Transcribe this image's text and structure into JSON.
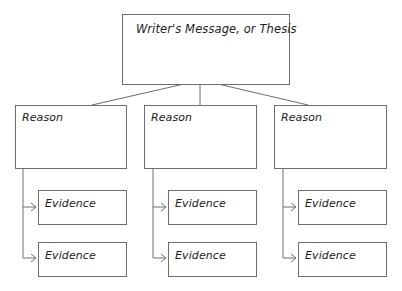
{
  "diagram": {
    "thesis": {
      "label": "Writer's Message, or Thesis"
    },
    "reasons": [
      {
        "label": "Reason",
        "evidence": [
          {
            "label": "Evidence"
          },
          {
            "label": "Evidence"
          }
        ]
      },
      {
        "label": "Reason",
        "evidence": [
          {
            "label": "Evidence"
          },
          {
            "label": "Evidence"
          }
        ]
      },
      {
        "label": "Reason",
        "evidence": [
          {
            "label": "Evidence"
          },
          {
            "label": "Evidence"
          }
        ]
      }
    ],
    "colors": {
      "line": "#6e6e6e",
      "text": "#222222"
    }
  }
}
